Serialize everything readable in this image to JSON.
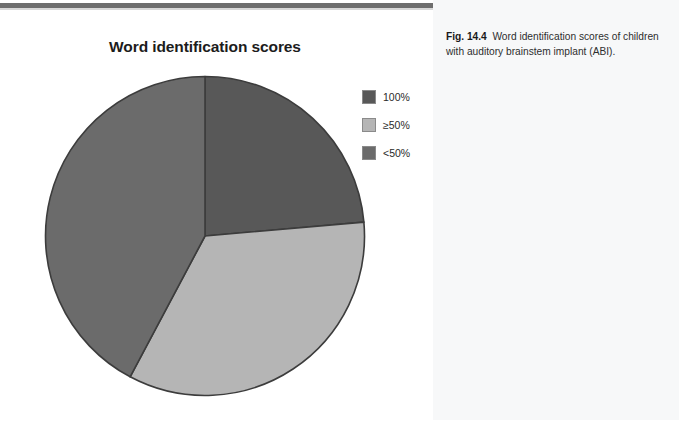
{
  "page": {
    "background": "#ffffff",
    "rule_color": "#6e6e6e"
  },
  "figure": {
    "title": "Word identification scores",
    "caption_label": "Fig. 14.4",
    "caption_text": "Word identification scores of children with auditory brainstem implant (ABI).",
    "caption_panel_color": "#f7f8f9"
  },
  "legend": {
    "items": [
      {
        "label": "100%",
        "color": "#585858"
      },
      {
        "label": "≥50%",
        "color": "#b5b5b5"
      },
      {
        "label": "<50%",
        "color": "#6b6b6b"
      }
    ]
  },
  "chart_data": {
    "type": "pie",
    "title": "Word identification scores",
    "categories": [
      "100%",
      "≥50%",
      "<50%"
    ],
    "values": [
      23.6,
      34.2,
      42.2
    ],
    "unit": "percent of children",
    "colors": [
      "#585858",
      "#b5b5b5",
      "#6b6b6b"
    ],
    "start_angle_deg": 0,
    "direction": "clockwise",
    "slice_boundaries_deg": [
      0,
      85,
      208,
      360
    ],
    "slice_outline_color": "#3c3c3c",
    "legend_position": "right",
    "grid": false,
    "xlabel": "",
    "ylabel": ""
  }
}
